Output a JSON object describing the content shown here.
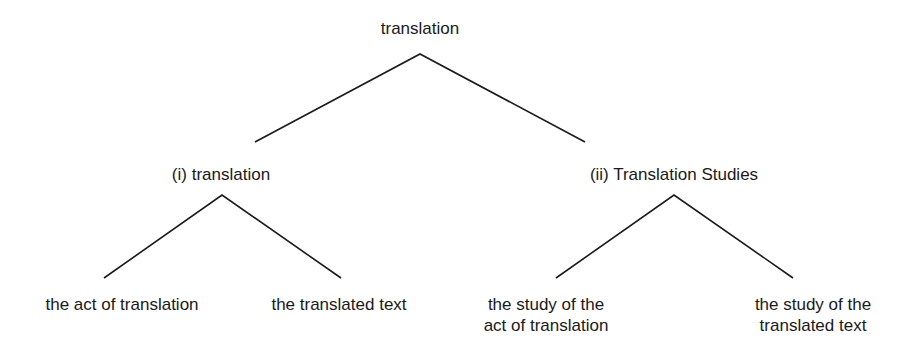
{
  "diagram": {
    "root": {
      "label": "translation"
    },
    "level1": [
      {
        "label": "(i) translation"
      },
      {
        "label": "(ii) Translation Studies"
      }
    ],
    "level2": [
      {
        "line1": "the act of translation",
        "line2": ""
      },
      {
        "line1": "the translated text",
        "line2": ""
      },
      {
        "line1": "the study of the",
        "line2": "act of translation"
      },
      {
        "line1": "the study of the",
        "line2": "translated text"
      }
    ],
    "line_color": "#1a1a1a"
  }
}
